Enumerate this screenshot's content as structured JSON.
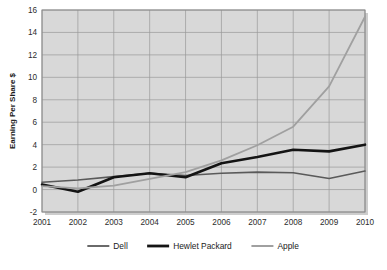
{
  "chart_data": {
    "type": "line",
    "title": "",
    "xlabel": "",
    "ylabel": "Earning Per Share $",
    "categories": [
      "2001",
      "2002",
      "2003",
      "2004",
      "2005",
      "2006",
      "2007",
      "2008",
      "2009",
      "2010"
    ],
    "x": [
      2001,
      2002,
      2003,
      2004,
      2005,
      2006,
      2007,
      2008,
      2009,
      2010
    ],
    "ylim": [
      -2,
      16
    ],
    "xlim": [
      2001,
      2010
    ],
    "yticks": [
      16,
      14,
      12,
      10,
      8,
      6,
      4,
      2,
      0,
      -2
    ],
    "ytick_labels": [
      "16",
      "14",
      "12",
      "10",
      "8",
      "6",
      "4",
      "2",
      "0",
      "-2"
    ],
    "grid": true,
    "legend_position": "bottom",
    "series": [
      {
        "name": "Dell",
        "color": "#5a5a5a",
        "width": 1.6,
        "values": [
          0.65,
          0.85,
          1.15,
          1.45,
          1.25,
          1.45,
          1.55,
          1.5,
          0.98,
          1.65
        ]
      },
      {
        "name": "Hewlet Packard",
        "color": "#141414",
        "width": 2.6,
        "values": [
          0.45,
          -0.2,
          1.1,
          1.45,
          1.1,
          2.35,
          2.9,
          3.55,
          3.4,
          4.0
        ]
      },
      {
        "name": "Apple",
        "color": "#a0a0a0",
        "width": 1.8,
        "values": [
          0.3,
          0.1,
          0.35,
          0.95,
          1.55,
          2.6,
          3.95,
          5.6,
          9.2,
          15.4
        ]
      }
    ]
  },
  "legend": {
    "items": [
      {
        "label": "Dell",
        "color": "#5a5a5a",
        "width": 1.8
      },
      {
        "label": "Hewlet Packard",
        "color": "#141414",
        "width": 2.8
      },
      {
        "label": "Apple",
        "color": "#a0a0a0",
        "width": 2.0
      }
    ]
  },
  "style": {
    "plot_background": "#d8d8d8",
    "page_background": "#ffffff",
    "grid_color": "#9a9a9a",
    "border_color": "#8a8a8a",
    "shadow_color": "#c9c9c9"
  }
}
